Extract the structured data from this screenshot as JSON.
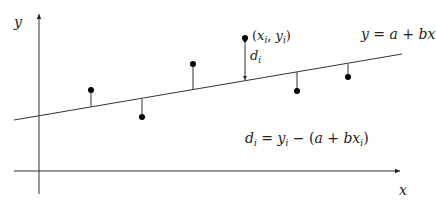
{
  "diagram": {
    "title_equation": "y = a + bx",
    "residual_equation": "d_i = y_i − (a + bx_i)",
    "axes": {
      "x_label": "x",
      "y_label": "y",
      "origin": {
        "x": 39,
        "y": 171
      },
      "x_axis": {
        "x1": 14,
        "x2": 402,
        "y": 171
      },
      "y_axis": {
        "x": 39,
        "y1": 194,
        "y2": 12
      }
    },
    "regression_line": {
      "x1": 14,
      "y1": 120,
      "x2": 402,
      "y2": 54
    },
    "points": [
      {
        "x": 91,
        "y": 90,
        "line_y": 107
      },
      {
        "x": 142,
        "y": 117,
        "line_y": 99
      },
      {
        "x": 193,
        "y": 64,
        "line_y": 90
      },
      {
        "x": 245,
        "y": 38,
        "line_y": 81,
        "highlighted": true
      },
      {
        "x": 297,
        "y": 91,
        "line_y": 72
      },
      {
        "x": 348,
        "y": 77,
        "line_y": 63
      }
    ],
    "highlight_label": {
      "text_open": "(",
      "x": "x",
      "x_sub": "i",
      "sep": ", ",
      "y": "y",
      "y_sub": "i",
      "text_close": ")"
    },
    "distance_label": {
      "base": "d",
      "sub": "i"
    },
    "line_label": {
      "lhs": "y",
      "eq": " = ",
      "a": "a",
      "plus": " + ",
      "bx": "bx"
    },
    "equation_parts": {
      "d": "d",
      "d_sub": "i",
      "eq": " = ",
      "y": "y",
      "y_sub": "i",
      "minus_open": " − (",
      "a": "a",
      "plus": " + ",
      "bx": "bx",
      "bx_sub": "i",
      "close": ")"
    }
  }
}
